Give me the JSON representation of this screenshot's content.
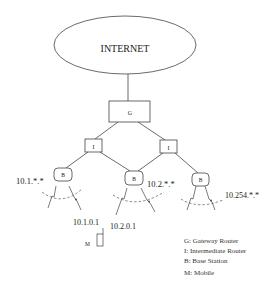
{
  "diagram": {
    "internet_label": "INTERNET",
    "nodes": {
      "gateway": "G",
      "intermediate_left": "I",
      "intermediate_right": "I",
      "base_left": "B",
      "base_middle": "B",
      "base_right": "B",
      "mobile": "M"
    },
    "subnets": {
      "left": "10.1.*.*",
      "middle": "10.2.*.*",
      "right": "10.254.*.*"
    },
    "addresses": {
      "mobile_home": "10.1.0.1",
      "mobile_care_of": "10.2.0.1"
    },
    "legend": [
      "G: Gateway Router",
      "I: Intermediate Router",
      "B: Base Station",
      "M: Mobile"
    ]
  }
}
